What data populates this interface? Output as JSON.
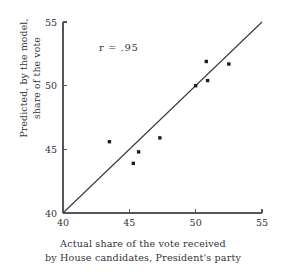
{
  "chart_data": {
    "type": "scatter",
    "title": "",
    "xlabel": "Actual share of the vote received by House candidates, President's party",
    "ylabel": "Predicted, by the model, share of the vote",
    "xlim": [
      40,
      55
    ],
    "ylim": [
      40,
      55
    ],
    "xticks": [
      40,
      45,
      50,
      55
    ],
    "yticks": [
      40,
      45,
      50,
      55
    ],
    "xtick_labels": [
      "40",
      "45",
      "50",
      "55"
    ],
    "ytick_labels": [
      "40",
      "45",
      "50",
      "55"
    ],
    "grid": false,
    "legend": false,
    "annotations": [
      {
        "text": "r  =  .95",
        "x": 44.2,
        "y": 52.7
      }
    ],
    "reference_line": {
      "name": "identity-line",
      "from": [
        40,
        40
      ],
      "to": [
        55,
        55
      ]
    },
    "points": [
      {
        "x": 43.5,
        "y": 45.6
      },
      {
        "x": 45.3,
        "y": 43.9
      },
      {
        "x": 45.7,
        "y": 44.8
      },
      {
        "x": 47.3,
        "y": 45.9
      },
      {
        "x": 50.0,
        "y": 50.0
      },
      {
        "x": 50.9,
        "y": 50.4
      },
      {
        "x": 50.8,
        "y": 51.9
      },
      {
        "x": 52.5,
        "y": 51.7
      }
    ]
  },
  "axis_labels": {
    "y_line1": "Predicted, by the model,",
    "y_line2": "share of the vote",
    "x_line1": "Actual share of the vote received",
    "x_line2": "by House candidates, President's party"
  },
  "colors": {
    "point": "#1d1d22",
    "line": "#3a3a42",
    "axis": "#55555c",
    "text": "#33333a",
    "background": "#ffffff"
  }
}
